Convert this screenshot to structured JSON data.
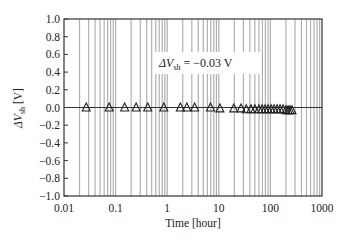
{
  "chart_data": {
    "type": "scatter",
    "title": "",
    "xlabel": "Time [hour]",
    "ylabel_prefix": "ΔV",
    "ylabel_sub": "sh",
    "ylabel_suffix": " [V]",
    "xscale": "log",
    "xlim": [
      0.01,
      1000
    ],
    "ylim": [
      -1.0,
      1.0
    ],
    "x_ticks": [
      "0.01",
      "0.1",
      "1",
      "10",
      "100",
      "1000"
    ],
    "y_ticks": [
      "1.0",
      "0.8",
      "0.6",
      "0.4",
      "0.2",
      "0.0",
      "−0.2",
      "−0.4",
      "−0.6",
      "−0.8",
      "−1.0"
    ],
    "grid": {
      "x_minor_vertical": true,
      "horizontal": false
    },
    "reference_line_y": 0.0,
    "marker": "open-triangle",
    "annotation": {
      "prefix": "ΔV",
      "sub": "sh",
      "suffix": " = −0.03 V"
    },
    "series": [
      {
        "name": "ΔVsh",
        "x": [
          0.027,
          0.075,
          0.15,
          0.25,
          0.42,
          0.86,
          1.8,
          2.4,
          3.4,
          6.9,
          10.5,
          19.5,
          27,
          34,
          42,
          50,
          60,
          69,
          79,
          90,
          103,
          118,
          135,
          154,
          176,
          201,
          220,
          240,
          262
        ],
        "y": [
          0.0,
          0.0,
          0.0,
          0.0,
          0.0,
          0.0,
          0.0,
          0.0,
          0.0,
          0.0,
          -0.01,
          -0.01,
          -0.01,
          -0.02,
          -0.02,
          -0.02,
          -0.02,
          -0.02,
          -0.02,
          -0.02,
          -0.02,
          -0.02,
          -0.02,
          -0.02,
          -0.02,
          -0.03,
          -0.03,
          -0.03,
          -0.03
        ]
      }
    ]
  },
  "colors": {
    "frame": "#333333",
    "grid": "#b0b0b0",
    "zero_line": "#333333",
    "marker_stroke": "#222222"
  }
}
